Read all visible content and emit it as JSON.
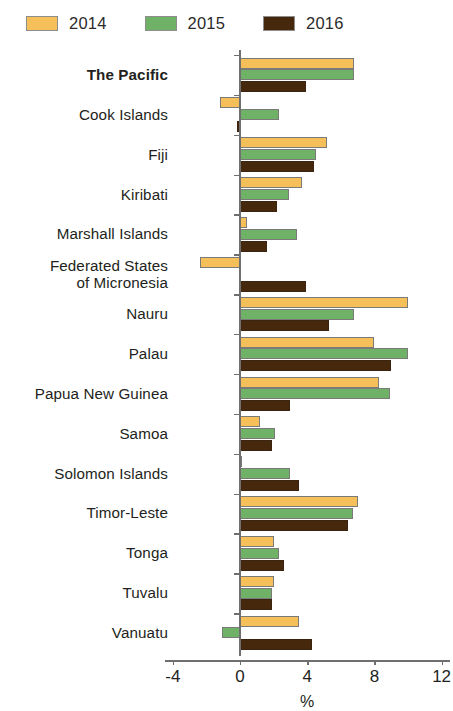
{
  "legend": {
    "items": [
      {
        "label": "2014",
        "color": "#F5C05A"
      },
      {
        "label": "2015",
        "color": "#6FB167"
      },
      {
        "label": "2016",
        "color": "#46280C"
      }
    ]
  },
  "axis": {
    "title": "%",
    "ticks": [
      "-4",
      "0",
      "4",
      "8",
      "12"
    ],
    "tick_values": [
      -4,
      0,
      4,
      8,
      12
    ],
    "min": -4,
    "max": 12
  },
  "chart_data": {
    "type": "bar",
    "orientation": "horizontal",
    "title": "",
    "subtitle": "",
    "xlabel": "%",
    "ylabel": "",
    "xlim": [
      -4,
      12
    ],
    "grid": false,
    "legend_position": "top-left",
    "categories": [
      "The Pacific",
      "Cook Islands",
      "Fiji",
      "Kiribati",
      "Marshall Islands",
      "Federated States\nof Micronesia",
      "Nauru",
      "Palau",
      "Papua New Guinea",
      "Samoa",
      "Solomon Islands",
      "Timor-Leste",
      "Tonga",
      "Tuvalu",
      "Vanuatu"
    ],
    "series": [
      {
        "name": "2014",
        "color": "#F5C05A",
        "values": [
          6.8,
          -1.2,
          5.2,
          3.7,
          0.4,
          -2.4,
          10.0,
          8.0,
          8.3,
          1.2,
          0.1,
          7.0,
          2.0,
          2.0,
          3.5
        ]
      },
      {
        "name": "2015",
        "color": "#6FB167",
        "values": [
          6.8,
          2.3,
          4.5,
          2.9,
          3.4,
          0.0,
          6.8,
          10.0,
          8.9,
          2.1,
          3.0,
          6.7,
          2.3,
          1.9,
          -1.1
        ]
      },
      {
        "name": "2016",
        "color": "#46280C",
        "values": [
          3.9,
          -0.2,
          4.4,
          2.2,
          1.6,
          3.9,
          5.3,
          9.0,
          3.0,
          1.9,
          3.5,
          6.4,
          2.6,
          1.9,
          4.3
        ]
      }
    ]
  }
}
